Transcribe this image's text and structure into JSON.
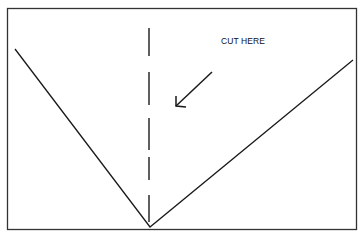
{
  "diagram": {
    "label": "CUT HERE",
    "colors": {
      "line": "#1a1a1a",
      "background": "#ffffff"
    },
    "elements": {
      "border": {
        "x": 7,
        "y": 8,
        "width": 350,
        "height": 222
      },
      "v_shape": {
        "left_top": [
          15,
          49
        ],
        "vertex": [
          150,
          227
        ],
        "right_top": [
          353,
          60
        ]
      },
      "dashed_cut_line": {
        "x": 149,
        "y_start": 28,
        "y_end": 222
      },
      "arrow": {
        "from": [
          212,
          72
        ],
        "to": [
          176,
          106
        ]
      }
    }
  }
}
